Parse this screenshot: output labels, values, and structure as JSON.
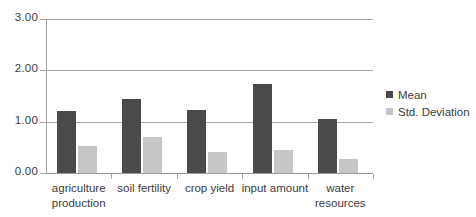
{
  "chart_data": {
    "type": "bar",
    "title": "",
    "xlabel": "",
    "ylabel": "",
    "ylim": [
      0,
      3
    ],
    "yticks": [
      "0.00",
      "1.00",
      "2.00",
      "3.00"
    ],
    "ytick_values": [
      0,
      1,
      2,
      3
    ],
    "grid": true,
    "legend_position": "right",
    "categories": [
      "agriculture\nproduction",
      "soil fertility",
      "crop yield",
      "input amount",
      "water\nresources"
    ],
    "series": [
      {
        "name": "Mean",
        "color": "#4a4a4a",
        "values": [
          1.2,
          1.45,
          1.22,
          1.73,
          1.05
        ]
      },
      {
        "name": "Std. Deviation",
        "color": "#c6c6c6",
        "values": [
          0.52,
          0.71,
          0.41,
          0.44,
          0.27
        ]
      }
    ]
  },
  "legend": {
    "items": [
      {
        "label": "Mean",
        "swatch": "mean"
      },
      {
        "label": "Std. Deviation",
        "swatch": "std"
      }
    ]
  },
  "axes": {
    "y_labels": [
      "3.00",
      "2.00",
      "1.00",
      "0.00"
    ]
  }
}
